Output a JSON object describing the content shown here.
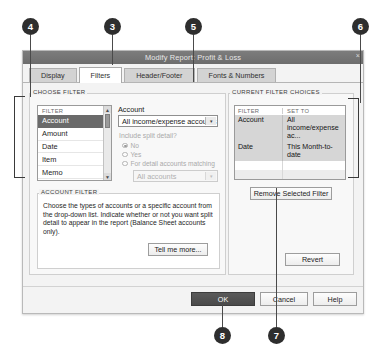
{
  "callouts": [
    {
      "id": "4",
      "x": 22,
      "y": 18,
      "lead_x": 30,
      "lead_top": 35,
      "lead_h": 62
    },
    {
      "id": "3",
      "x": 104,
      "y": 18,
      "lead_x": 112,
      "lead_top": 35,
      "lead_h": 30
    },
    {
      "id": "5",
      "x": 185,
      "y": 18,
      "lead_x": 193,
      "lead_top": 35,
      "lead_h": 47
    },
    {
      "id": "6",
      "x": 352,
      "y": 18,
      "lead_x": 360,
      "lead_top": 35,
      "lead_h": 68
    },
    {
      "id": "8",
      "x": 214,
      "y": 327,
      "lead_x": 222,
      "lead_top": 303,
      "lead_h": 24
    },
    {
      "id": "7",
      "x": 268,
      "y": 327,
      "lead_x": 276,
      "lead_top": 188,
      "lead_h": 139
    }
  ],
  "window": {
    "title": "Modify Report: Profit & Loss",
    "close_icon": "×"
  },
  "tabs": [
    {
      "label": "Display",
      "mnemonic": "D",
      "active": false,
      "name": "tab-display"
    },
    {
      "label": "Filters",
      "mnemonic": "F",
      "active": true,
      "name": "tab-filters"
    },
    {
      "label": "Header/Footer",
      "mnemonic": "H",
      "active": false,
      "name": "tab-header-footer"
    },
    {
      "label": "Fonts & Numbers",
      "mnemonic": "o",
      "active": false,
      "name": "tab-fonts-numbers"
    }
  ],
  "choose_filter": {
    "group_label": "CHOOSE FILTER",
    "list_header": "FILTER",
    "items": [
      {
        "label": "Account",
        "selected": true
      },
      {
        "label": "Amount",
        "selected": false
      },
      {
        "label": "Date",
        "selected": false
      },
      {
        "label": "Item",
        "selected": false
      },
      {
        "label": "Memo",
        "selected": false
      }
    ],
    "scroll_up_icon": "▲",
    "scroll_down_icon": "▼",
    "account_label": "Account",
    "account_value": "All income/expense accounts",
    "dropdown_icon": "▾",
    "split_question": "Include split detail?",
    "radios": [
      {
        "label": "No",
        "checked": true
      },
      {
        "label": "Yes",
        "checked": false
      },
      {
        "label": "For detail accounts matching",
        "checked": false
      }
    ],
    "all_accounts_value": "All accounts"
  },
  "account_filter_help": {
    "group_label": "ACCOUNT FILTER",
    "text": "Choose the types of accounts or a specific account from the drop-down list. Indicate whether or not you want split detail to appear in the report (Balance Sheet accounts only).",
    "tell_me_more_label": "Tell me more...",
    "tell_me_more_mnemonic": "T"
  },
  "current_filter_choices": {
    "group_label": "CURRENT FILTER CHOICES",
    "columns": [
      "FILTER",
      "SET TO"
    ],
    "rows": [
      {
        "filter": "Account",
        "set_to": "All income/expense ac..."
      },
      {
        "filter": "Date",
        "set_to": "This Month-to-date"
      }
    ],
    "remove_button_label": "Remove Selected Filter",
    "remove_button_mnemonic": "R",
    "revert_button_label": "Revert",
    "revert_button_mnemonic": "e"
  },
  "footer": {
    "ok_label": "OK",
    "cancel_label": "Cancel",
    "help_label": "Help"
  },
  "colors": {
    "titlebar": "#6d6d6d",
    "selection": "#6a6a6a",
    "ok_button": "#4a4a4a",
    "dialog_bg": "#f3f3f3",
    "callout": "#2e2e2e"
  }
}
